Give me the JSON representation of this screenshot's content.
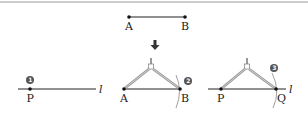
{
  "figure": {
    "top_segment": {
      "start_label": "A",
      "end_label": "B"
    },
    "arrow": "down-arrow",
    "steps": [
      {
        "number": "1",
        "point_label": "P",
        "line_label": "l"
      },
      {
        "number": "2",
        "start_label": "A",
        "end_label": "B"
      },
      {
        "number": "3",
        "start_label": "P",
        "end_label": "Q",
        "line_label": "l"
      }
    ]
  },
  "colors": {
    "line": "#222222",
    "compass": "#888888",
    "badge": "#555555",
    "border": "#bbbbbb"
  }
}
